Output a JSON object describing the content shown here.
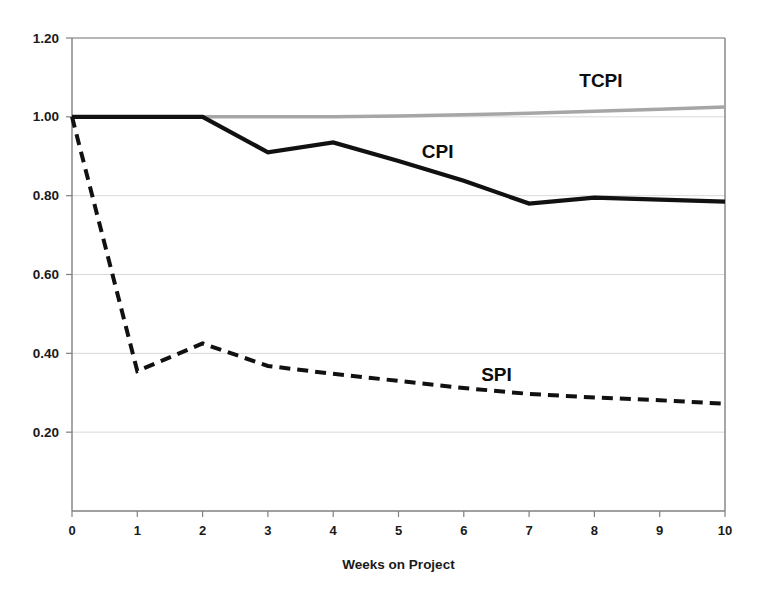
{
  "chart_data": {
    "type": "line",
    "title": "",
    "subtitle": "",
    "xlabel": "Weeks on Project",
    "ylabel": "",
    "x": [
      0,
      1,
      2,
      3,
      4,
      5,
      6,
      7,
      8,
      9,
      10
    ],
    "xtick_labels": [
      "0",
      "1",
      "2",
      "3",
      "4",
      "5",
      "6",
      "7",
      "8",
      "9",
      "10"
    ],
    "ytick_labels": [
      "0.20",
      "0.40",
      "0.60",
      "0.80",
      "1.00",
      "1.20"
    ],
    "ytick_values": [
      0.2,
      0.4,
      0.6,
      0.8,
      1.0,
      1.2
    ],
    "xlim": [
      0,
      10
    ],
    "ylim": [
      0.0,
      1.2
    ],
    "grid": true,
    "grid_axis": "y",
    "legend_position": "inline-annotation",
    "series": [
      {
        "name": "TCPI",
        "label": "TCPI",
        "color": "#a6a6a6",
        "style": "solid",
        "width": 3.5,
        "label_x": 8.1,
        "label_y": 1.075,
        "values": [
          1.0,
          1.0,
          1.0,
          1.0,
          1.0,
          1.002,
          1.005,
          1.009,
          1.014,
          1.019,
          1.025
        ]
      },
      {
        "name": "CPI",
        "label": "CPI",
        "color": "#111111",
        "style": "solid",
        "width": 4.2,
        "label_x": 5.6,
        "label_y": 0.895,
        "values": [
          1.0,
          1.0,
          1.0,
          0.91,
          0.935,
          0.888,
          0.838,
          0.78,
          0.795,
          0.79,
          0.785
        ]
      },
      {
        "name": "SPI",
        "label": "SPI",
        "color": "#111111",
        "style": "dashed",
        "width": 4.0,
        "label_x": 6.5,
        "label_y": 0.33,
        "values": [
          1.0,
          0.355,
          0.425,
          0.368,
          0.348,
          0.33,
          0.312,
          0.297,
          0.288,
          0.281,
          0.272
        ]
      }
    ],
    "colors": {
      "axis": "#808080",
      "grid": "#d9d9d9",
      "text": "#1a1a1a",
      "background": "#ffffff",
      "tcpi": "#a6a6a6",
      "cpi": "#111111",
      "spi": "#111111"
    },
    "plot_area": {
      "left": 72,
      "right": 725,
      "top": 38,
      "bottom": 511
    }
  }
}
